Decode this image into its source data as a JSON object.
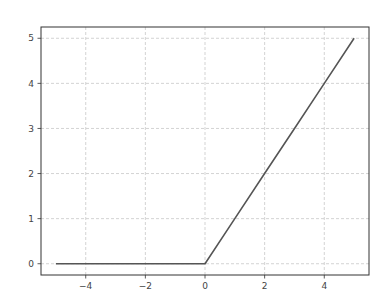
{
  "chart_data": {
    "type": "line",
    "title": "",
    "xlabel": "",
    "ylabel": "",
    "xlim": [
      -5.5,
      5.5
    ],
    "ylim": [
      -0.25,
      5.25
    ],
    "grid": true,
    "legend": null,
    "xticks": [
      -4,
      -2,
      0,
      2,
      4
    ],
    "xtick_labels": [
      "−4",
      "−2",
      "0",
      "2",
      "4"
    ],
    "yticks": [
      0,
      1,
      2,
      3,
      4,
      5
    ],
    "ytick_labels": [
      "0",
      "1",
      "2",
      "3",
      "4",
      "5"
    ],
    "series": [
      {
        "name": "ReLU",
        "color": "#555555",
        "x": [
          -5,
          -4,
          -3,
          -2,
          -1,
          0,
          1,
          2,
          3,
          4,
          5
        ],
        "y": [
          0,
          0,
          0,
          0,
          0,
          0,
          1,
          2,
          3,
          4,
          5
        ]
      }
    ]
  },
  "layout": {
    "plot_left": 41,
    "plot_right": 369,
    "plot_top": 27,
    "plot_bottom": 275
  },
  "colors": {
    "axes": "#333333",
    "grid": "#c8c8c8",
    "line": "#555555"
  }
}
